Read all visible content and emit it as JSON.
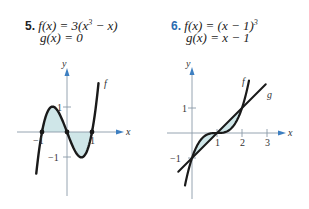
{
  "problems": [
    {
      "number": "5.",
      "number_color": "#222222",
      "f_label": "f(x) = 3(x",
      "f_sup": "3",
      "f_tail": " − x)",
      "g_label": "g(x) = 0"
    },
    {
      "number": "6.",
      "number_color": "#2b6cb0",
      "f_label": "f(x) = (x − 1)",
      "f_sup": "3",
      "f_tail": "",
      "g_label": "g(x) = x − 1"
    }
  ],
  "chart_data": [
    {
      "type": "line",
      "title": "f(x) = 3(x^3 − x), g(x) = 0",
      "xlabel": "x",
      "ylabel": "y",
      "x_ticks": [
        -1,
        1
      ],
      "y_ticks": [
        1,
        -1
      ],
      "series": [
        {
          "name": "f",
          "function": "3(x^3 - x)",
          "x_range": [
            -1.25,
            1.25
          ]
        }
      ],
      "shaded_regions": [
        {
          "between": [
            "f",
            "g"
          ],
          "x_range": [
            -1,
            0
          ]
        },
        {
          "between": [
            "f",
            "g"
          ],
          "x_range": [
            0,
            1
          ]
        }
      ],
      "intersection_points": [
        [
          -1,
          0
        ],
        [
          0,
          0
        ],
        [
          1,
          0
        ]
      ],
      "curve_label": "f"
    },
    {
      "type": "line",
      "title": "f(x) = (x − 1)^3, g(x) = x − 1",
      "xlabel": "x",
      "ylabel": "y",
      "x_ticks": [
        1,
        2,
        3
      ],
      "y_ticks": [
        1,
        -1
      ],
      "series": [
        {
          "name": "f",
          "function": "(x - 1)^3",
          "x_range": [
            -0.3,
            2.3
          ]
        },
        {
          "name": "g",
          "function": "x - 1",
          "x_range": [
            -0.5,
            2.9
          ]
        }
      ],
      "shaded_regions": [
        {
          "between": [
            "f",
            "g"
          ],
          "x_range": [
            0,
            1
          ]
        },
        {
          "between": [
            "f",
            "g"
          ],
          "x_range": [
            1,
            2
          ]
        }
      ],
      "intersection_points": [
        [
          0,
          -1
        ],
        [
          1,
          0
        ],
        [
          2,
          1
        ]
      ],
      "curve_labels": [
        "f",
        "g"
      ]
    }
  ],
  "labels": {
    "y": "y",
    "x": "x",
    "f": "f",
    "g": "g",
    "neg1": "−1",
    "one": "1",
    "two": "2",
    "three": "3"
  },
  "colors": {
    "axis": "#8a9aa8",
    "arrow": "#3d7fc1",
    "curve": "#1a1a1a",
    "shade": "#cfe6e8"
  }
}
